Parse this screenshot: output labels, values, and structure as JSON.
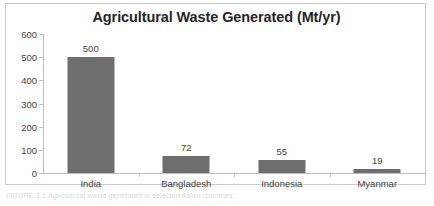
{
  "figure": {
    "caption_strip": "FIGURE 3.1  Agricultural waste generated in selected Asian countries."
  },
  "chart_data": {
    "type": "bar",
    "title": "Agricultural Waste Generated (Mt/yr)",
    "xlabel": "",
    "ylabel": "",
    "categories": [
      "India",
      "Bangladesh",
      "Indonesia",
      "Myanmar"
    ],
    "values": [
      500,
      72,
      55,
      19
    ],
    "value_labels": [
      "500",
      "72",
      "55",
      "19"
    ],
    "ylim": [
      0,
      600
    ],
    "yticks": [
      600,
      500,
      400,
      300,
      200,
      100,
      0
    ],
    "ytick_labels": [
      "600",
      "500",
      "400",
      "300",
      "200",
      "100",
      "0"
    ],
    "grid": false,
    "legend": null,
    "bar_color": "#6e6e6e",
    "axis_color": "#bfbfbf",
    "text_color": "#3f3f3f",
    "title_color": "#262626",
    "frame_color": "#c9cccf",
    "background": "#ffffff"
  }
}
